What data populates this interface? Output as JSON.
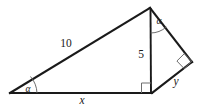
{
  "figure": {
    "background_color": "#ffffff",
    "line_color": "#1a1a1a",
    "marker_color": "#6e6e6e",
    "labels": {
      "hypotenuse": "10",
      "altitude": "5",
      "base": "x",
      "right_side": "y",
      "angle_left": "α",
      "angle_apex": "α"
    },
    "markers": {
      "right_angle_base": "right-angle-square",
      "right_angle_corner": "right-angle-square",
      "angle_arc_left": "angle-arc",
      "angle_arc_apex": "angle-arc"
    },
    "vertices": {
      "left": [
        10,
        93
      ],
      "apex": [
        150,
        8
      ],
      "foot": [
        151,
        93
      ],
      "right": [
        192,
        62
      ]
    }
  }
}
